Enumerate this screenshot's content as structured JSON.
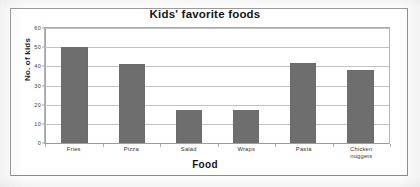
{
  "chart_data": {
    "type": "bar",
    "title": "Kids' favorite foods",
    "xlabel": "Food",
    "ylabel": "No. of kids",
    "categories": [
      "Fries",
      "Pizza",
      "Salad",
      "Wraps",
      "Pasta",
      "Chicken nuggets"
    ],
    "values": [
      50,
      41,
      17,
      17,
      42,
      38
    ],
    "ylim": [
      0,
      60
    ],
    "ytick_labels": [
      "60",
      "50",
      "40",
      "30",
      "20",
      "10",
      "0"
    ],
    "ytick_values": [
      60,
      50,
      40,
      30,
      20,
      10,
      0
    ],
    "grid": true,
    "legend": false,
    "bar_color": "#6e6e6e",
    "gridline_color": "#c2c2c2",
    "axis_color": "#a5a5a5",
    "plot_background": "#ffffff"
  },
  "figure": {
    "background": "#ffffff",
    "frame_color": "#9a9a9a"
  }
}
